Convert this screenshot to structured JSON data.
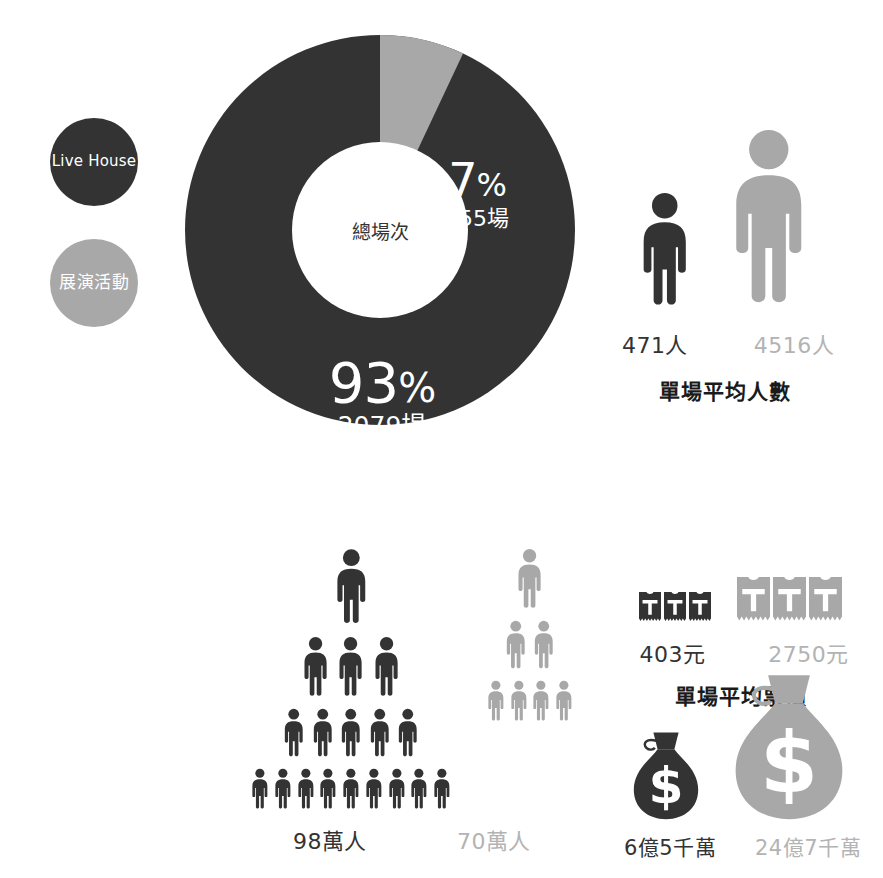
{
  "colors": {
    "dark": "#333333",
    "gray": "#a8a8a8",
    "gray_text": "#b3b3b3",
    "background": "#ffffff",
    "label_text": "#ffffff"
  },
  "legend": {
    "items": [
      {
        "label": "Live House",
        "color_key": "dark"
      },
      {
        "label": "展演活動",
        "color_key": "gray"
      }
    ]
  },
  "chart_data": {
    "type": "pie",
    "title": "總場次",
    "center_label": "總場次",
    "categories": [
      "Live House",
      "展演活動"
    ],
    "values": [
      2079,
      155
    ],
    "percents": [
      93,
      7
    ],
    "labels": [
      {
        "percent": "93",
        "percent_symbol": "%",
        "value": "2079場"
      },
      {
        "percent": "7",
        "percent_symbol": "%",
        "value": "155場"
      }
    ],
    "legend_position": "left",
    "grid": false
  },
  "metrics": [
    {
      "id": "attendance",
      "caption": "單場平均人數",
      "icon": "person-icon",
      "series": [
        {
          "name": "Live House",
          "value": "471人",
          "number": 471,
          "color_key": "dark"
        },
        {
          "name": "展演活動",
          "value": "4516人",
          "number": 4516,
          "color_key": "gray"
        }
      ]
    },
    {
      "id": "crowd",
      "caption": "",
      "icon": "person-icon",
      "series": [
        {
          "name": "Live House",
          "value": "98萬人",
          "number": 980000,
          "color_key": "dark",
          "pyramid_rows": [
            1,
            3,
            5,
            9
          ]
        },
        {
          "name": "展演活動",
          "value": "70萬人",
          "number": 700000,
          "color_key": "gray",
          "pyramid_rows": [
            1,
            2,
            4
          ]
        }
      ]
    },
    {
      "id": "tickets",
      "caption": "單場平均票價",
      "icon": "ticket-icon",
      "series": [
        {
          "name": "Live House",
          "value": "403元",
          "number": 403,
          "color_key": "dark",
          "icon_count": 3
        },
        {
          "name": "展演活動",
          "value": "2750元",
          "number": 2750,
          "color_key": "gray",
          "icon_count": 3
        }
      ]
    },
    {
      "id": "revenue",
      "caption": "",
      "icon": "money-bag-icon",
      "series": [
        {
          "name": "Live House",
          "value": "6億5千萬",
          "color_key": "dark"
        },
        {
          "name": "展演活動",
          "value": "24億7千萬",
          "color_key": "gray"
        }
      ]
    }
  ]
}
